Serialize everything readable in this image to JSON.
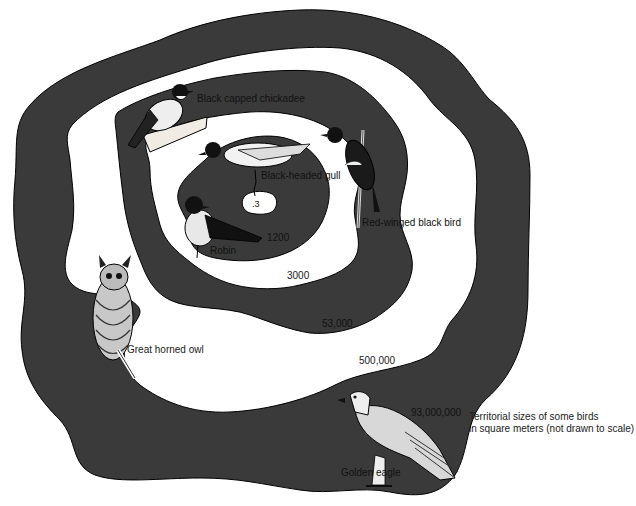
{
  "title": "Territorial sizes of some birds in square meters (not drawn to scale)",
  "caption": {
    "line1": "Territorial sizes of some birds",
    "line2": "in square meters (not drawn to scale)"
  },
  "colors": {
    "territory_fill": "#3a3a3a",
    "background": "#ffffff",
    "outline": "#000000"
  },
  "birds": [
    {
      "name": "Black-headed gull",
      "label": "Black-headed gull",
      "area": ".3"
    },
    {
      "name": "Robin",
      "label": "Robin",
      "area": "1200"
    },
    {
      "name": "Black capped chickadee",
      "label": "Black capped chickadee",
      "area": "3000"
    },
    {
      "name": "Red-winged black bird",
      "label": "Red-winged black bird",
      "area": "53,000"
    },
    {
      "name": "Great horned owl",
      "label": "Great horned owl",
      "area": "500,000"
    },
    {
      "name": "Golden eagle",
      "label": "Golden eagle",
      "area": "93,000,000"
    }
  ],
  "area_labels": {
    "gull": ".3",
    "robin": "1200",
    "chickadee": "3000",
    "blackbird": "53,000",
    "owl": "500,000",
    "eagle": "93,000,000"
  }
}
